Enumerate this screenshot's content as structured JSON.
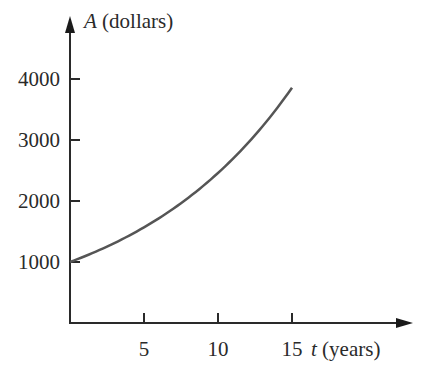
{
  "chart_data": {
    "type": "line",
    "title": "",
    "xlabel_var": "t",
    "xlabel_unit": "(years)",
    "ylabel_var": "A",
    "ylabel_unit": "(dollars)",
    "x_ticks": [
      5,
      10,
      15
    ],
    "y_ticks": [
      1000,
      2000,
      3000,
      4000
    ],
    "xlim": [
      0,
      15
    ],
    "ylim": [
      0,
      4000
    ],
    "grid": false,
    "series": [
      {
        "name": "A(t)",
        "x": [
          0,
          2.5,
          5,
          7.5,
          10,
          12.5,
          15
        ],
        "values": [
          1000,
          1252,
          1568,
          1964,
          2460,
          3080,
          3857
        ]
      }
    ],
    "colors": {
      "axis": "#2a2a2a",
      "curve": "#555555"
    }
  }
}
